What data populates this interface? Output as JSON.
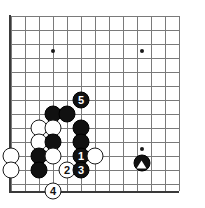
{
  "diagram": {
    "kind": "go-board-diagram",
    "board": {
      "origin_x": 11,
      "origin_y": 16,
      "spacing": 14,
      "cols": 13,
      "rows": 13,
      "edges": [
        "left",
        "bottom"
      ],
      "line_color": "#7a7a7a",
      "edge_color": "#3a3a3a",
      "background": "#ffffff"
    },
    "star_points": [
      {
        "col": 3,
        "row": 2.5
      },
      {
        "col": 9.35,
        "row": 2.5
      },
      {
        "col": 9.35,
        "row": 9.5
      }
    ],
    "stones": [
      {
        "color": "black",
        "label": "",
        "col": 3,
        "row": 7
      },
      {
        "color": "black",
        "label": "",
        "col": 4,
        "row": 7
      },
      {
        "color": "white",
        "label": "",
        "col": 2,
        "row": 8
      },
      {
        "color": "white",
        "label": "",
        "col": 3,
        "row": 8
      },
      {
        "color": "black",
        "label": "",
        "col": 5,
        "row": 8
      },
      {
        "color": "white",
        "label": "",
        "col": 2,
        "row": 9
      },
      {
        "color": "black",
        "label": "",
        "col": 3,
        "row": 9
      },
      {
        "color": "black",
        "label": "",
        "col": 5,
        "row": 9
      },
      {
        "color": "white",
        "label": "",
        "col": 0,
        "row": 10
      },
      {
        "color": "black",
        "label": "",
        "col": 2,
        "row": 10
      },
      {
        "color": "white",
        "label": "",
        "col": 3,
        "row": 10
      },
      {
        "color": "black",
        "label": "1",
        "col": 5,
        "row": 10
      },
      {
        "color": "white",
        "label": "",
        "col": 6,
        "row": 10
      },
      {
        "color": "white",
        "label": "",
        "col": 0,
        "row": 11
      },
      {
        "color": "black",
        "label": "",
        "col": 2,
        "row": 11
      },
      {
        "color": "white",
        "label": "2",
        "col": 4,
        "row": 11
      },
      {
        "color": "black",
        "label": "3",
        "col": 5,
        "row": 11
      },
      {
        "color": "white",
        "label": "4",
        "col": 3,
        "row": 12.5
      },
      {
        "color": "black",
        "label": "5",
        "col": 5,
        "row": 6
      },
      {
        "color": "black",
        "label": "triangle",
        "col": 9.35,
        "row": 10.5
      }
    ],
    "move_numbers": [
      "1",
      "2",
      "3",
      "4",
      "5"
    ],
    "marks": [
      "triangle"
    ]
  }
}
